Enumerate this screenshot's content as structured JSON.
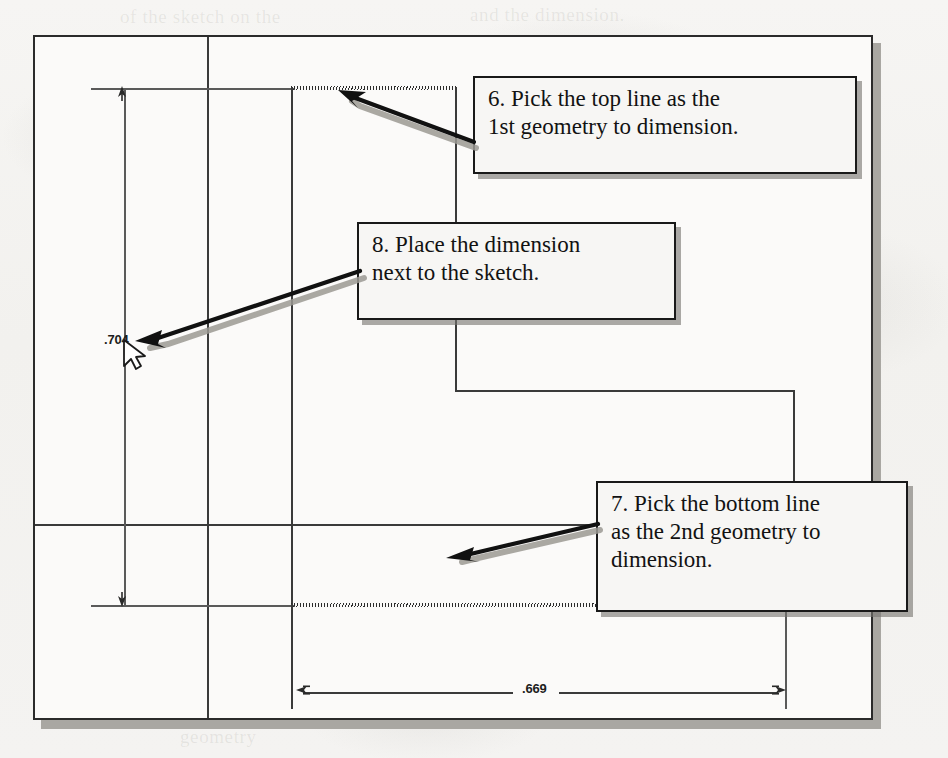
{
  "document": {
    "type": "scanned-cad-tutorial-page",
    "frame": {
      "label": "sketch-drawing-frame"
    }
  },
  "dimensions": [
    {
      "name": "vertical-dimension",
      "value": ".704",
      "orientation": "vertical",
      "text_x": 104,
      "text_y": 339
    },
    {
      "name": "horizontal-dimension",
      "value": ".669",
      "orientation": "horizontal",
      "text_x": 522,
      "text_y": 681
    }
  ],
  "callouts": [
    {
      "id": "callout-step-6",
      "step": "6",
      "lines": [
        "6. Pick the top line as the",
        "1st geometry to dimension."
      ],
      "box": {
        "x": 473,
        "y": 76,
        "w": 384,
        "h": 98
      }
    },
    {
      "id": "callout-step-8",
      "step": "8",
      "lines": [
        "8. Place the dimension",
        "next to the sketch."
      ],
      "box": {
        "x": 357,
        "y": 222,
        "w": 319,
        "h": 98
      }
    },
    {
      "id": "callout-step-7",
      "step": "7",
      "lines": [
        "7. Pick the bottom line",
        "as the 2nd geometry to",
        "dimension."
      ],
      "box": {
        "x": 596,
        "y": 481,
        "w": 312,
        "h": 131
      }
    }
  ],
  "cursor": {
    "name": "mouse-pointer",
    "x": 124,
    "y": 344
  },
  "ghost_text": [
    {
      "t": "of the sketch on the",
      "x": 120,
      "y": 6
    },
    {
      "t": "and the dimension.",
      "x": 470,
      "y": 4
    },
    {
      "t": "to in the",
      "x": 170,
      "y": 34
    },
    {
      "t": "selected geometry",
      "x": 480,
      "y": 36
    },
    {
      "t": "dimension value",
      "x": 640,
      "y": 66
    },
    {
      "t": "left... and right...",
      "x": 620,
      "y": 96
    },
    {
      "t": "the sketch.",
      "x": 650,
      "y": 126
    },
    {
      "t": "A",
      "x": 60,
      "y": 200
    },
    {
      "t": "change the",
      "x": 600,
      "y": 168
    },
    {
      "t": "Note: a sketch",
      "x": 72,
      "y": 260
    },
    {
      "t": "in the drawing window,",
      "x": 68,
      "y": 292
    },
    {
      "t": "select the geometry",
      "x": 500,
      "y": 262
    },
    {
      "t": "then the dimension.",
      "x": 520,
      "y": 292
    },
    {
      "t": "sketch",
      "x": 60,
      "y": 322
    },
    {
      "t": "bottom",
      "x": 720,
      "y": 400
    },
    {
      "t": "Figure",
      "x": 820,
      "y": 690
    },
    {
      "t": "geometry",
      "x": 180,
      "y": 726
    }
  ],
  "colors": {
    "paper": "#f4f3f1",
    "frame_line": "#2b2b2b",
    "geometry_line": "#3a3a3a",
    "callout_border": "#191919",
    "callout_fill": "#f7f6f4",
    "shadow": "#78766f",
    "arrow": "#111111",
    "arrow_shadow": "#9b9993"
  }
}
